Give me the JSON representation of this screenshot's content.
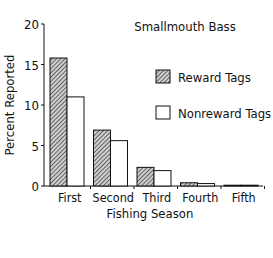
{
  "chart_data": {
    "type": "bar",
    "title": "Smallmouth Bass",
    "xlabel": "Fishing Season",
    "ylabel": "Percent Reported",
    "categories": [
      "First",
      "Second",
      "Third",
      "Fourth",
      "Fifth"
    ],
    "series": [
      {
        "name": "Reward Tags",
        "pattern": "hatched",
        "values": [
          15.8,
          6.9,
          2.3,
          0.4,
          0.05
        ]
      },
      {
        "name": "Nonreward Tags",
        "pattern": "open",
        "values": [
          11.0,
          5.6,
          1.9,
          0.3,
          0.1
        ]
      }
    ],
    "ylim": [
      0,
      20
    ],
    "yticks": [
      "0",
      "5",
      "10",
      "15",
      "20"
    ],
    "grid": false,
    "legend_position": "upper right"
  },
  "colors": {
    "axis": "#111111",
    "hatch_fill": "#9a9a9a",
    "open_fill": "#ffffff"
  }
}
